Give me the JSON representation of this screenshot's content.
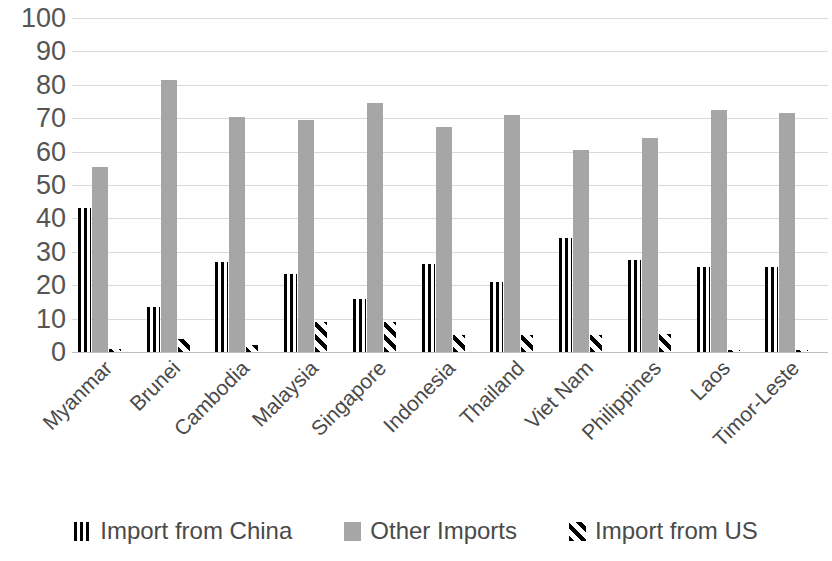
{
  "chart_data": {
    "type": "bar",
    "title": "",
    "subtitle": "",
    "xlabel": "",
    "ylabel": "",
    "ylim": [
      0,
      100
    ],
    "ytick_labels": [
      "100",
      "90",
      "80",
      "70",
      "60",
      "50",
      "40",
      "30",
      "20",
      "10",
      "0"
    ],
    "ytick_values": [
      100,
      90,
      80,
      70,
      60,
      50,
      40,
      30,
      20,
      10,
      0
    ],
    "grid": true,
    "legend_position": "bottom",
    "categories": [
      "Myanmar",
      "Brunei",
      "Cambodia",
      "Malaysia",
      "Singapore",
      "Indonesia",
      "Thailand",
      "Viet Nam",
      "Philippines",
      "Laos",
      "Timor-Leste"
    ],
    "series": [
      {
        "name": "Import from China",
        "pattern": "vertical-stripes",
        "color": "#000000",
        "values": [
          43,
          13.5,
          27,
          23.5,
          16,
          26.5,
          21,
          34,
          27.5,
          25.5,
          25.5
        ]
      },
      {
        "name": "Other Imports",
        "pattern": "solid",
        "color": "#a6a6a6",
        "values": [
          55.5,
          81.5,
          70.5,
          69.5,
          74.5,
          67.5,
          71,
          60.5,
          64,
          72.5,
          71.5
        ]
      },
      {
        "name": "Import from US",
        "pattern": "diagonal-stripes",
        "color": "#000000",
        "values": [
          1,
          4,
          2,
          9,
          9,
          5,
          5,
          5,
          5.5,
          0.5,
          0.5
        ]
      }
    ]
  },
  "legend": {
    "items": [
      {
        "label": "Import from China",
        "swatch": "china-swatch-icon"
      },
      {
        "label": "Other Imports",
        "swatch": "other-imports-swatch-icon"
      },
      {
        "label": "Import from US",
        "swatch": "us-swatch-icon"
      }
    ]
  }
}
